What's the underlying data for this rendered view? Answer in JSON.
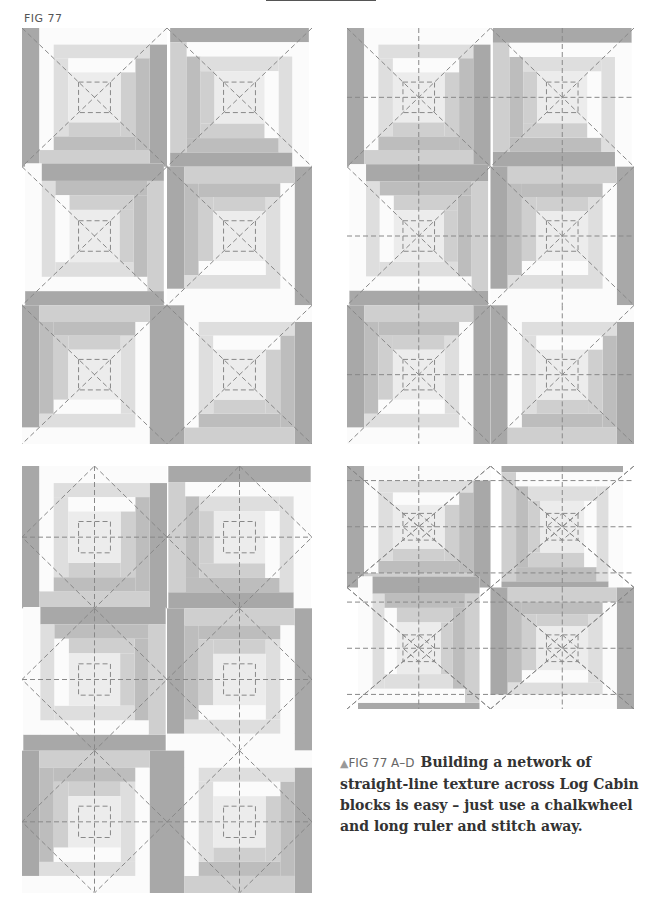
{
  "header": {
    "figure_label": "FIG 77"
  },
  "colors": {
    "white": "#fbfbfb",
    "very_light": "#ececec",
    "light": "#dedede",
    "mid_light": "#cfcfcf",
    "mid": "#bdbdbd",
    "dark": "#a8a8a8",
    "stitch": "#888888"
  },
  "panels": [
    {
      "id": "A",
      "cols": 2,
      "rows": 3,
      "stitching": "diagonal + centre square"
    },
    {
      "id": "B",
      "cols": 2,
      "rows": 3,
      "stitching": "diagonal + centre square + cross"
    },
    {
      "id": "C",
      "cols": 2,
      "rows": 3,
      "stitching": "diamond + cross + centre square"
    },
    {
      "id": "D",
      "cols": 2,
      "rows": 2,
      "stitching": "grid + diagonal + diamond centre"
    }
  ],
  "caption": {
    "marker": "▲",
    "tag": "FIG 77 A–D",
    "text": "Building a network of straight-line texture across Log Cabin blocks is easy – just use a chalkwheel and long ruler and stitch away."
  }
}
